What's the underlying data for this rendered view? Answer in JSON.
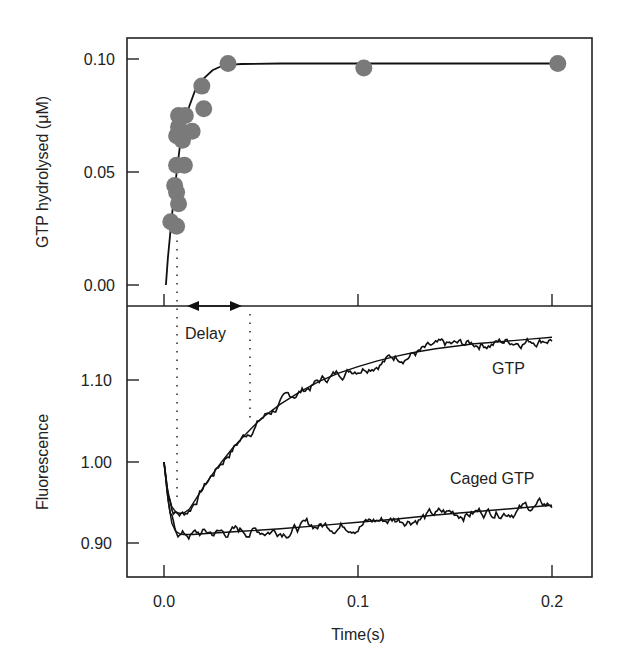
{
  "chart_data": [
    {
      "type": "scatter",
      "panel": "top",
      "title": "",
      "xlabel": "Time(s)",
      "ylabel": "GTP hydrolysed (μM)",
      "xlim": [
        -0.019,
        0.221
      ],
      "ylim": [
        -0.004,
        0.111
      ],
      "x_ticks": [
        "0.0",
        "0.1",
        "0.2"
      ],
      "y_ticks": [
        "0.00",
        "0.05",
        "0.10"
      ],
      "grid": false,
      "points": [
        {
          "x": 0.0035,
          "y": 0.028
        },
        {
          "x": 0.0065,
          "y": 0.026
        },
        {
          "x": 0.0055,
          "y": 0.044
        },
        {
          "x": 0.0065,
          "y": 0.041
        },
        {
          "x": 0.0075,
          "y": 0.036
        },
        {
          "x": 0.0065,
          "y": 0.053
        },
        {
          "x": 0.0105,
          "y": 0.053
        },
        {
          "x": 0.0065,
          "y": 0.066
        },
        {
          "x": 0.0095,
          "y": 0.064
        },
        {
          "x": 0.0075,
          "y": 0.07
        },
        {
          "x": 0.0145,
          "y": 0.068
        },
        {
          "x": 0.0075,
          "y": 0.075
        },
        {
          "x": 0.011,
          "y": 0.075
        },
        {
          "x": 0.0205,
          "y": 0.078
        },
        {
          "x": 0.0195,
          "y": 0.088
        },
        {
          "x": 0.033,
          "y": 0.098
        },
        {
          "x": 0.103,
          "y": 0.096
        },
        {
          "x": 0.203,
          "y": 0.098
        }
      ],
      "fit_curve": {
        "x": [
          0.001,
          0.002,
          0.004,
          0.006,
          0.008,
          0.01,
          0.013,
          0.016,
          0.02,
          0.025,
          0.03,
          0.035,
          0.04,
          0.06,
          0.1,
          0.2
        ],
        "y": [
          0.0,
          0.012,
          0.03,
          0.046,
          0.06,
          0.07,
          0.079,
          0.086,
          0.091,
          0.095,
          0.097,
          0.0975,
          0.0978,
          0.098,
          0.098,
          0.098
        ]
      },
      "marker_color": "#7a7a7a"
    },
    {
      "type": "line",
      "panel": "bottom",
      "title": "",
      "xlabel": "Time(s)",
      "ylabel": "Fluorescence",
      "xlim": [
        -0.019,
        0.221
      ],
      "ylim": [
        0.86,
        1.19
      ],
      "x_ticks": [
        "0.0",
        "0.1",
        "0.2"
      ],
      "y_ticks": [
        "0.90",
        "1.00",
        "1.10"
      ],
      "grid": false,
      "series": [
        {
          "name": "GTP",
          "x": [
            0.0,
            0.002,
            0.004,
            0.006,
            0.008,
            0.01,
            0.013,
            0.016,
            0.02,
            0.025,
            0.03,
            0.035,
            0.04,
            0.045,
            0.05,
            0.06,
            0.07,
            0.08,
            0.09,
            0.1,
            0.11,
            0.12,
            0.13,
            0.14,
            0.15,
            0.16,
            0.17,
            0.18,
            0.19,
            0.2
          ],
          "y": [
            1.0,
            0.962,
            0.945,
            0.939,
            0.937,
            0.937,
            0.942,
            0.953,
            0.968,
            0.985,
            1.001,
            1.016,
            1.029,
            1.041,
            1.053,
            1.071,
            1.086,
            1.099,
            1.109,
            1.117,
            1.124,
            1.13,
            1.135,
            1.139,
            1.142,
            1.145,
            1.147,
            1.149,
            1.151,
            1.153
          ]
        },
        {
          "name": "Caged GTP",
          "x": [
            0.0,
            0.002,
            0.004,
            0.006,
            0.008,
            0.01,
            0.015,
            0.02,
            0.04,
            0.06,
            0.08,
            0.1,
            0.12,
            0.14,
            0.16,
            0.18,
            0.2
          ],
          "y": [
            1.0,
            0.955,
            0.925,
            0.915,
            0.912,
            0.911,
            0.911,
            0.912,
            0.915,
            0.918,
            0.922,
            0.926,
            0.93,
            0.935,
            0.939,
            0.943,
            0.947
          ]
        }
      ],
      "annotations": [
        {
          "text": "GTP",
          "x": 0.17,
          "y": 1.125
        },
        {
          "text": "Caged GTP",
          "x": 0.165,
          "y": 0.96
        },
        {
          "text": "Delay",
          "x": 0.026,
          "y": 1.165,
          "span": [
            0.007,
            0.044
          ],
          "style": "dotted vertical lines with double-headed arrow"
        }
      ]
    }
  ],
  "labels": {
    "top_ylabel": "GTP hydrolysed (μM)",
    "bottom_ylabel": "Fluorescence",
    "xlabel": "Time(s)",
    "delay": "Delay",
    "gtp": "GTP",
    "caged_gtp": "Caged GTP",
    "x_ticks": [
      "0.0",
      "0.1",
      "0.2"
    ],
    "top_y_ticks": [
      "0.10",
      "0.05",
      "0.00"
    ],
    "bottom_y_ticks": [
      "1.10",
      "1.00",
      "0.90"
    ]
  }
}
